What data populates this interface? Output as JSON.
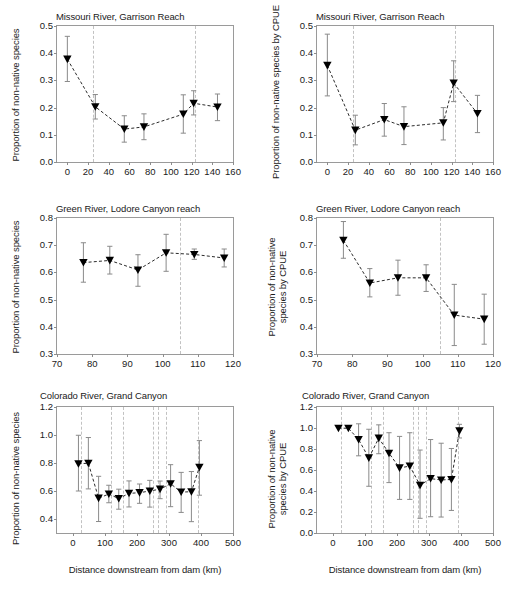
{
  "figure": {
    "panel_count": 6,
    "caption_fragment": ""
  },
  "chart_data": [
    {
      "id": "missouri-proportion",
      "type": "scatter",
      "title": "Missouri River, Garrison Reach",
      "xlabel": "",
      "ylabel": "Proportion of non-native species",
      "xlim": [
        -10,
        160
      ],
      "ylim": [
        0.0,
        0.5
      ],
      "xticks": [
        0,
        20,
        40,
        60,
        80,
        100,
        120,
        140,
        160
      ],
      "yticks": [
        "0.0",
        "0.1",
        "0.2",
        "0.3",
        "0.4",
        "0.5"
      ],
      "grid": false,
      "legend": "none",
      "marker": "filled-down-triangle",
      "line_style": "dashed",
      "vlines": [
        25,
        123
      ],
      "x": [
        0,
        27,
        55,
        74,
        112,
        122,
        145
      ],
      "values": [
        0.378,
        0.203,
        0.121,
        0.129,
        0.176,
        0.216,
        0.202
      ],
      "err_low": [
        0.296,
        0.158,
        0.073,
        0.082,
        0.106,
        0.173,
        0.152
      ],
      "err_high": [
        0.462,
        0.248,
        0.17,
        0.177,
        0.247,
        0.262,
        0.25
      ]
    },
    {
      "id": "missouri-cpue",
      "type": "scatter",
      "title": "Missouri River, Garrison Reach",
      "xlabel": "",
      "ylabel": "Proportion of non-native species by CPUE",
      "xlim": [
        -10,
        160
      ],
      "ylim": [
        0.0,
        0.5
      ],
      "xticks": [
        0,
        20,
        40,
        60,
        80,
        100,
        120,
        140,
        160
      ],
      "yticks": [
        "0.0",
        "0.1",
        "0.2",
        "0.3",
        "0.4",
        "0.5"
      ],
      "grid": false,
      "legend": "none",
      "marker": "filled-down-triangle",
      "line_style": "dashed",
      "vlines": [
        25,
        123
      ],
      "x": [
        0,
        27,
        55,
        74,
        112,
        122,
        145
      ],
      "values": [
        0.355,
        0.117,
        0.156,
        0.13,
        0.144,
        0.29,
        0.178
      ],
      "err_low": [
        0.243,
        0.063,
        0.095,
        0.064,
        0.081,
        0.222,
        0.108
      ],
      "err_high": [
        0.47,
        0.172,
        0.215,
        0.203,
        0.2,
        0.372,
        0.245
      ]
    },
    {
      "id": "green-proportion",
      "type": "scatter",
      "title": "Green River, Lodore Canyon reach",
      "xlabel": "",
      "ylabel": "Proportion of non-native species",
      "xlim": [
        70,
        120
      ],
      "ylim": [
        0.3,
        0.8
      ],
      "xticks": [
        70,
        80,
        90,
        100,
        110,
        120
      ],
      "yticks": [
        "0.3",
        "0.4",
        "0.5",
        "0.6",
        "0.7",
        "0.8"
      ],
      "grid": false,
      "legend": "none",
      "marker": "filled-down-triangle",
      "line_style": "dashed",
      "vlines": [
        105
      ],
      "x": [
        77.5,
        85,
        93,
        101,
        109,
        117.5
      ],
      "values": [
        0.636,
        0.644,
        0.609,
        0.672,
        0.666,
        0.653
      ],
      "err_low": [
        0.564,
        0.594,
        0.549,
        0.604,
        0.648,
        0.62
      ],
      "err_high": [
        0.709,
        0.696,
        0.665,
        0.74,
        0.686,
        0.686
      ]
    },
    {
      "id": "green-cpue",
      "type": "scatter",
      "title": "Green River, Lodore Canyon reach",
      "xlabel": "",
      "ylabel": "Proportion of non-native species by CPUE",
      "xlim": [
        70,
        120
      ],
      "ylim": [
        0.3,
        0.8
      ],
      "xticks": [
        70,
        80,
        90,
        100,
        110,
        120
      ],
      "yticks": [
        "0.3",
        "0.4",
        "0.5",
        "0.6",
        "0.7",
        "0.8"
      ],
      "grid": false,
      "legend": "none",
      "marker": "filled-down-triangle",
      "line_style": "dashed",
      "vlines": [
        105
      ],
      "x": [
        77.5,
        85,
        93,
        101,
        109,
        117.5
      ],
      "values": [
        0.718,
        0.561,
        0.58,
        0.58,
        0.443,
        0.428
      ],
      "err_low": [
        0.652,
        0.51,
        0.516,
        0.53,
        0.331,
        0.336
      ],
      "err_high": [
        0.787,
        0.614,
        0.645,
        0.628,
        0.556,
        0.52
      ]
    },
    {
      "id": "colorado-proportion",
      "type": "scatter",
      "title": "Colorado River, Grand Canyon",
      "xlabel": "Distance downstream from dam (km)",
      "ylabel": "Proportion of non-native species",
      "xlim": [
        -50,
        500
      ],
      "ylim": [
        0.3,
        1.2
      ],
      "xticks": [
        0,
        100,
        200,
        300,
        400,
        500
      ],
      "yticks": [
        "0.4",
        "0.6",
        "0.8",
        "1.0",
        "1.2"
      ],
      "grid": false,
      "legend": "none",
      "marker": "filled-down-triangle",
      "line_style": "dashed",
      "vlines": [
        25,
        120,
        155,
        250,
        265,
        290,
        390
      ],
      "x": [
        17,
        48,
        80,
        112,
        143,
        175,
        208,
        240,
        272,
        305,
        338,
        370,
        395
      ],
      "values": [
        0.795,
        0.798,
        0.549,
        0.578,
        0.546,
        0.583,
        0.588,
        0.6,
        0.613,
        0.652,
        0.592,
        0.595,
        0.77
      ],
      "err_low": [
        0.6,
        0.615,
        0.382,
        0.516,
        0.47,
        0.486,
        0.512,
        0.485,
        0.545,
        0.488,
        0.447,
        0.381,
        0.57
      ],
      "err_high": [
        0.998,
        0.982,
        0.705,
        0.641,
        0.613,
        0.672,
        0.65,
        0.676,
        0.671,
        0.788,
        0.733,
        0.739,
        0.96
      ]
    },
    {
      "id": "colorado-cpue",
      "type": "scatter",
      "title": "Colorado River, Grand Canyon",
      "xlabel": "Distance downstream from dam (km)",
      "ylabel": "Proportion of non-native species by CPUE",
      "xlim": [
        -50,
        500
      ],
      "ylim": [
        0.0,
        1.2
      ],
      "xticks": [
        0,
        100,
        200,
        300,
        400,
        500
      ],
      "yticks": [
        "0.0",
        "0.2",
        "0.4",
        "0.6",
        "0.8",
        "1.0",
        "1.2"
      ],
      "grid": false,
      "legend": "none",
      "marker": "filled-down-triangle",
      "line_style": "dashed",
      "vlines": [
        25,
        120,
        155,
        250,
        265,
        290,
        390
      ],
      "x": [
        17,
        48,
        80,
        112,
        143,
        175,
        208,
        240,
        272,
        305,
        338,
        370,
        395
      ],
      "values": [
        0.998,
        0.998,
        0.89,
        0.715,
        0.903,
        0.76,
        0.62,
        0.637,
        0.455,
        0.518,
        0.505,
        0.51,
        0.972
      ],
      "err_low": [
        0.998,
        0.998,
        0.735,
        0.445,
        0.755,
        0.48,
        0.32,
        0.32,
        0.14,
        0.155,
        0.152,
        0.215,
        0.905
      ],
      "err_high": [
        0.998,
        0.998,
        1.04,
        0.988,
        1.03,
        0.955,
        0.92,
        0.955,
        0.79,
        0.89,
        0.855,
        0.805,
        1.035
      ]
    }
  ]
}
